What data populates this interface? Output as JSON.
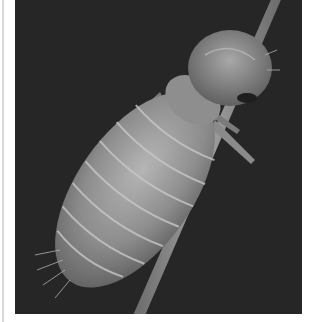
{
  "image": {
    "subject": "Scanning electron micrograph of a louse nymph clinging to a hair",
    "background_color": "#262626",
    "subject_color": "#9a9a9a",
    "frame_color": "#ffffff"
  }
}
